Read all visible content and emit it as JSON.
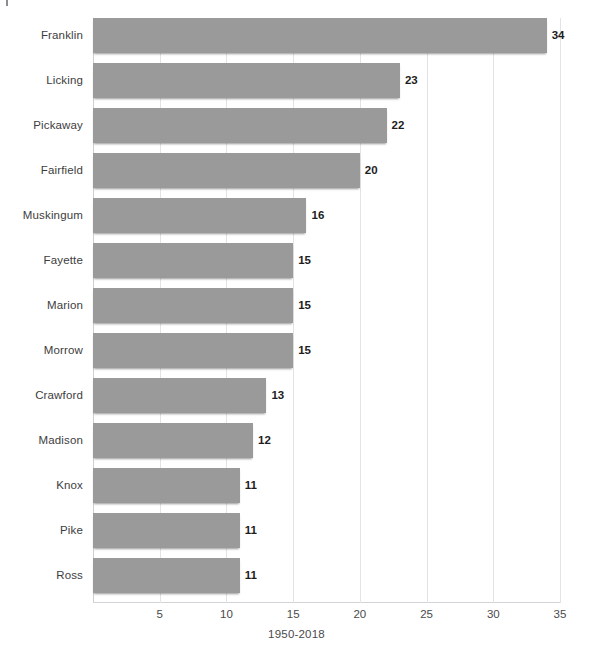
{
  "top_crop_remnant": "",
  "chart_data": {
    "type": "bar",
    "orientation": "horizontal",
    "title": "",
    "subtitle": "",
    "xlabel": "1950-2018",
    "ylabel": "",
    "xlim": [
      0,
      35
    ],
    "xticks": [
      5,
      10,
      15,
      20,
      25,
      30,
      35
    ],
    "xtick_labels": [
      "5",
      "10",
      "15",
      "20",
      "25",
      "30",
      "35"
    ],
    "grid": "vertical",
    "legend": "none",
    "bar_color": "#9a9a9a",
    "value_label_color": "#1d1d1d",
    "categories": [
      "Franklin",
      "Licking",
      "Pickaway",
      "Fairfield",
      "Muskingum",
      "Fayette",
      "Marion",
      "Morrow",
      "Crawford",
      "Madison",
      "Knox",
      "Pike",
      "Ross"
    ],
    "values": [
      34,
      23,
      22,
      20,
      16,
      15,
      15,
      15,
      13,
      12,
      11,
      11,
      11
    ],
    "value_labels": [
      "34",
      "23",
      "22",
      "20",
      "16",
      "15",
      "15",
      "15",
      "13",
      "12",
      "11",
      "11",
      "11"
    ]
  }
}
